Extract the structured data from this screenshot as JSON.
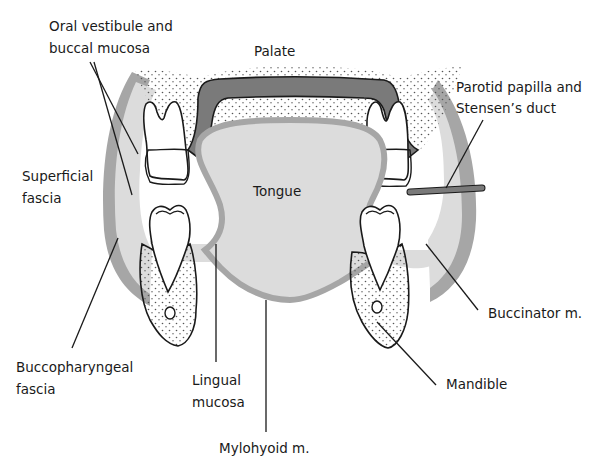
{
  "diagram": {
    "labels": {
      "oral_vestibule_1": "Oral vestibule and",
      "oral_vestibule_2": "buccal mucosa",
      "palate": "Palate",
      "parotid_1": "Parotid papilla and",
      "parotid_2": "Stensen’s duct",
      "superficial_1": "Superficial",
      "superficial_2": "fascia",
      "tongue": "Tongue",
      "buccinator": "Buccinator m.",
      "buccopharyngeal_1": "Buccopharyngeal",
      "buccopharyngeal_2": "fascia",
      "lingual_1": "Lingual",
      "lingual_2": "mucosa",
      "mandible": "Mandible",
      "mylohyoid": "Mylohyoid m."
    },
    "colors": {
      "light_gray": "#dcdcdc",
      "mid_gray": "#a6a6a6",
      "dark_gray": "#7a7a7a",
      "outline": "#1a1a1a",
      "background": "#ffffff"
    }
  }
}
